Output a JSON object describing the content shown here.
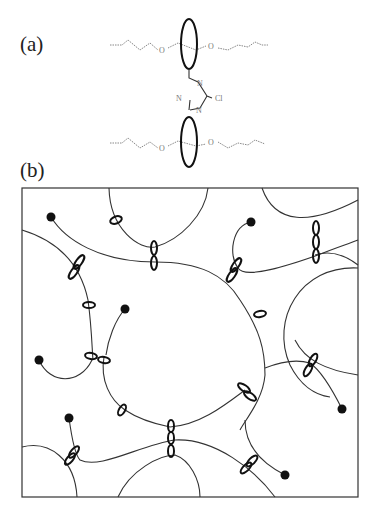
{
  "panels": {
    "a": {
      "label": "(a)"
    },
    "b": {
      "label": "(b)"
    }
  },
  "molecule": {
    "atoms": {
      "o_top_left": "O",
      "o_top_right": "O",
      "o_bot_left": "O",
      "o_bot_right": "O",
      "n_top": "N",
      "n_left": "N",
      "n_bot": "N",
      "cl": "Cl"
    }
  },
  "network": {
    "frame": {
      "x": 22,
      "y": 188,
      "width": 336,
      "height": 309
    },
    "end_groups": [
      [
        51,
        217
      ],
      [
        251,
        222
      ],
      [
        125,
        309
      ],
      [
        39,
        360
      ],
      [
        69,
        418
      ],
      [
        342,
        409
      ],
      [
        285,
        475
      ]
    ]
  }
}
